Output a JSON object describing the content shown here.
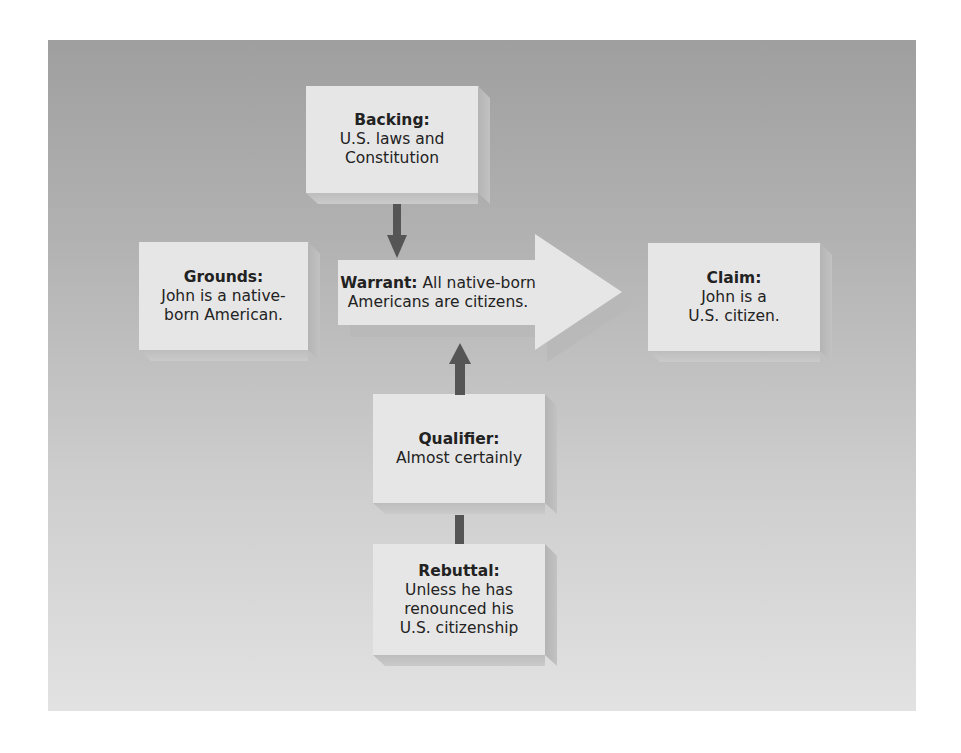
{
  "diagram": {
    "background_colors": {
      "top": "#9f9f9f",
      "bottom": "#e2e2e2"
    },
    "box_color": "#e6e6e6",
    "connector_color": "#555555",
    "nodes": {
      "backing": {
        "label": "Backing:",
        "lines": [
          "U.S. laws and",
          "Constitution"
        ]
      },
      "grounds": {
        "label": "Grounds:",
        "lines": [
          "John is a native-",
          "born American."
        ]
      },
      "warrant": {
        "label": "Warrant:",
        "lines": [
          "All native-born",
          "Americans are citizens."
        ]
      },
      "claim": {
        "label": "Claim:",
        "lines": [
          "John is a",
          "U.S. citizen."
        ]
      },
      "qualifier": {
        "label": "Qualifier:",
        "lines": [
          "Almost certainly"
        ]
      },
      "rebuttal": {
        "label": "Rebuttal:",
        "lines": [
          "Unless he has",
          "renounced his",
          "U.S. citizenship"
        ]
      }
    },
    "edges": [
      {
        "from": "backing",
        "to": "warrant",
        "type": "arrow-down"
      },
      {
        "from": "qualifier",
        "to": "warrant",
        "type": "arrow-up"
      },
      {
        "from": "rebuttal",
        "to": "qualifier",
        "type": "line"
      },
      {
        "from": "grounds",
        "to": "claim",
        "via": "warrant",
        "type": "big-arrow-right"
      }
    ]
  }
}
